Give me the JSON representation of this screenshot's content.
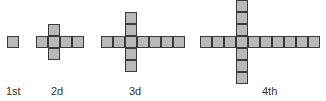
{
  "diagram": {
    "cell_size": 12,
    "cell_fill": "#b9b9b9",
    "cell_border": "#3a3a3a",
    "figures": [
      {
        "label": "1st",
        "label_x": 6,
        "cells": [
          [
            7,
            36
          ]
        ]
      },
      {
        "label": "2d",
        "label_x": 51,
        "cells": [
          [
            48,
            24
          ],
          [
            36,
            36
          ],
          [
            48,
            36
          ],
          [
            60,
            36
          ],
          [
            72,
            36
          ],
          [
            48,
            48
          ]
        ]
      },
      {
        "label": "3d",
        "label_x": 129,
        "cells": [
          [
            125,
            12
          ],
          [
            125,
            24
          ],
          [
            101,
            36
          ],
          [
            113,
            36
          ],
          [
            125,
            36
          ],
          [
            137,
            36
          ],
          [
            149,
            36
          ],
          [
            161,
            36
          ],
          [
            173,
            36
          ],
          [
            125,
            48
          ],
          [
            125,
            60
          ]
        ]
      },
      {
        "label": "4th",
        "label_x": 262,
        "cells": [
          [
            236,
            0
          ],
          [
            236,
            12
          ],
          [
            236,
            24
          ],
          [
            200,
            36
          ],
          [
            212,
            36
          ],
          [
            224,
            36
          ],
          [
            236,
            36
          ],
          [
            248,
            36
          ],
          [
            260,
            36
          ],
          [
            272,
            36
          ],
          [
            284,
            36
          ],
          [
            296,
            36
          ],
          [
            308,
            36
          ],
          [
            236,
            48
          ],
          [
            236,
            60
          ],
          [
            236,
            72
          ]
        ]
      }
    ]
  }
}
